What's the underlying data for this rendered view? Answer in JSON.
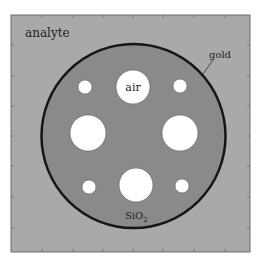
{
  "figure": {
    "type": "cross-section diagram",
    "labels": {
      "analyte": "analyte",
      "gold": "gold",
      "air": "air",
      "silica_main": "SiO",
      "silica_sub": "2"
    },
    "colors": {
      "background": "#ffffff",
      "analyte_region": "#a9a9a9",
      "silica_core": "#8a8a8a",
      "gold_ring": "#151515",
      "air_hole": "#ffffff",
      "frame": "#6e6e6e",
      "text": "#222222"
    },
    "frame": {
      "x": 11,
      "y": 15,
      "width": 239,
      "height": 237
    },
    "fiber": {
      "cx": 133.5,
      "cy": 136,
      "r": 92,
      "ring_width": 2.5
    },
    "air_holes": [
      {
        "name": "small-top-left",
        "cx": 85,
        "cy": 87,
        "r": 7
      },
      {
        "name": "large-top",
        "cx": 133,
        "cy": 87,
        "r": 17
      },
      {
        "name": "small-top-right",
        "cx": 180,
        "cy": 86,
        "r": 7
      },
      {
        "name": "large-left",
        "cx": 88,
        "cy": 133,
        "r": 18
      },
      {
        "name": "large-right",
        "cx": 180,
        "cy": 133,
        "r": 18
      },
      {
        "name": "small-bottom-left",
        "cx": 89,
        "cy": 187,
        "r": 7
      },
      {
        "name": "large-bottom",
        "cx": 136,
        "cy": 185,
        "r": 17
      },
      {
        "name": "small-bottom-right",
        "cx": 182,
        "cy": 186,
        "r": 7
      }
    ],
    "ticks": {
      "top": [
        42,
        73,
        103,
        133,
        163,
        194,
        225
      ],
      "bottom": [
        42,
        73,
        103,
        133,
        163,
        194,
        225
      ],
      "left": [
        45,
        76,
        106,
        136,
        166,
        197,
        228
      ],
      "right": [
        45,
        76,
        106,
        136,
        166,
        197,
        228
      ]
    }
  }
}
